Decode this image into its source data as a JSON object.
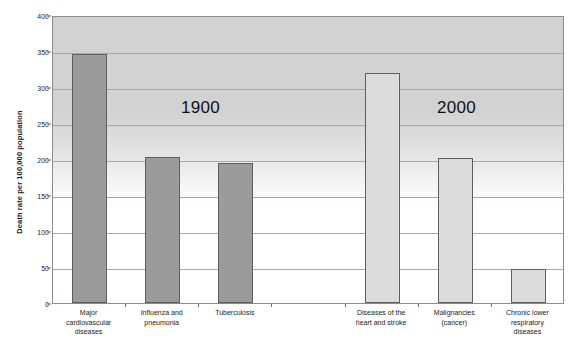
{
  "chart_data": {
    "type": "bar",
    "title": "",
    "subtitle": "",
    "xlabel": "",
    "ylabel": "Death rate per 100,000 population",
    "ylim": [
      0,
      400
    ],
    "ytick_values": [
      0,
      50,
      100,
      150,
      200,
      250,
      300,
      350,
      400
    ],
    "ytick_labels": [
      "0",
      "50",
      "100",
      "150",
      "200",
      "250",
      "300",
      "350",
      "400"
    ],
    "grid": true,
    "legend": "none",
    "categories": [
      "Major cardiovascular diseases",
      "Influenza and pneumonia",
      "Tuberculosis",
      "",
      "Diseases of the heart and stroke",
      "Malignancies (cancer)",
      "Chronic lower respiratory diseases"
    ],
    "values": [
      346,
      203,
      194,
      null,
      319,
      201,
      47
    ],
    "bars": [
      {
        "label": "Major cardiovascular diseases",
        "label_lines": [
          "Major",
          "cardiovascular",
          "diseases"
        ],
        "value": 346,
        "era": "1900",
        "color": "#9b9b9b"
      },
      {
        "label": "Influenza and pneumonia",
        "label_lines": [
          "Influenza and",
          "pneumonia"
        ],
        "value": 203,
        "era": "1900",
        "color": "#9b9b9b"
      },
      {
        "label": "Tuberculosis",
        "label_lines": [
          "Tuberculosis"
        ],
        "value": 194,
        "era": "1900",
        "color": "#9b9b9b"
      },
      {
        "label": "",
        "label_lines": [],
        "value": null,
        "era": "",
        "color": ""
      },
      {
        "label": "Diseases of the heart and stroke",
        "label_lines": [
          "Diseases of the",
          "heart and stroke"
        ],
        "value": 319,
        "era": "2000",
        "color": "#dcdcdc"
      },
      {
        "label": "Malignancies (cancer)",
        "label_lines": [
          "Malignancies",
          "(cancer)"
        ],
        "value": 201,
        "era": "2000",
        "color": "#dcdcdc"
      },
      {
        "label": "Chronic lower respiratory diseases",
        "label_lines": [
          "Chronic lower",
          "respiratory",
          "diseases"
        ],
        "value": 47,
        "era": "2000",
        "color": "#dcdcdc"
      }
    ],
    "annotations": [
      {
        "text": "1900",
        "value_x": 1.55,
        "value_y": 272
      },
      {
        "text": "2000",
        "value_x": 5.05,
        "value_y": 272
      }
    ],
    "colors": {
      "era_1900_fill": "#9b9b9b",
      "era_2000_fill": "#dcdcdc",
      "bar_edge": "#5e5e5e",
      "gridline": "#a8a8a8",
      "plot_border": "#8c8c8c",
      "text": "#1a1a1a"
    }
  },
  "annotations_text": {
    "era_1900": "1900",
    "era_2000": "2000"
  },
  "axis": {
    "y_title": "Death rate per 100,000 population"
  }
}
